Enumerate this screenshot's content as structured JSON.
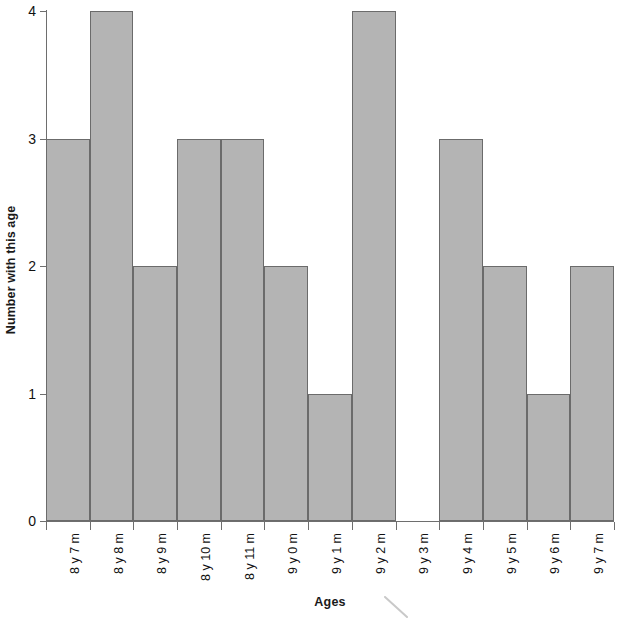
{
  "chart_data": {
    "type": "bar",
    "title": "",
    "xlabel": "Ages",
    "ylabel": "Number with this age",
    "categories": [
      "8 y 7 m",
      "8 y 8 m",
      "8 y 9 m",
      "8 y 10 m",
      "8 y 11 m",
      "9 y 0 m",
      "9 y 1 m",
      "9 y 2 m",
      "9 y 3 m",
      "9 y 4 m",
      "9 y 5 m",
      "9 y 6 m",
      "9 y 7 m"
    ],
    "values": [
      3,
      4,
      2,
      3,
      3,
      2,
      1,
      4,
      0,
      3,
      2,
      1,
      2
    ],
    "ylim": [
      0,
      4
    ],
    "yticks": [
      "0",
      "1",
      "2",
      "3",
      "4"
    ],
    "ytick_values": [
      0,
      1,
      2,
      3,
      4
    ],
    "grid": false,
    "legend": null,
    "bar_fill_color": "#b4b4b4",
    "bar_border_color": "#6b6b6b",
    "axis_color": "#6e6e6e",
    "background_color": "#ffffff",
    "adjacent_bars": true
  }
}
